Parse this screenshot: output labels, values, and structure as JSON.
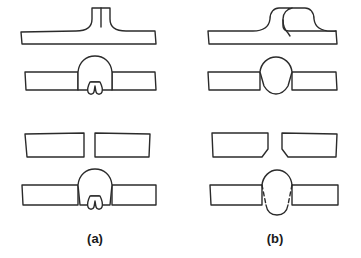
{
  "figure": {
    "background_color": "#ffffff",
    "line_color": "#2b2b2b",
    "fill_color": "#ffffff",
    "stroke_width": 1.4,
    "width": 361,
    "height": 258,
    "columns": [
      {
        "id": "a",
        "caption": "(a)",
        "caption_x": 95,
        "caption_y": 243,
        "description": "Improper joint preparation producing root defect"
      },
      {
        "id": "b",
        "caption": "(b)",
        "caption_x": 275,
        "caption_y": 243,
        "description": "Correct joint preparation producing sound weld"
      }
    ],
    "rows": [
      {
        "index": 0,
        "name": "tee-joint-preparation",
        "label": "T-joint / upset preparation, unwelded"
      },
      {
        "index": 1,
        "name": "tee-joint-welded",
        "label": "T-joint preparation after welding"
      },
      {
        "index": 2,
        "name": "butt-plate-preparation",
        "label": "Butt plates edge preparation, unwelded"
      },
      {
        "index": 3,
        "name": "butt-joint-welded",
        "label": "Butt joint after welding"
      }
    ],
    "panels": [
      {
        "name": "panel-a-row1",
        "column": "a",
        "row": 0,
        "type": "tee-preparation-square-root",
        "has_root_defect": false,
        "fusion_line_style": "solid"
      },
      {
        "name": "panel-b-row1",
        "column": "b",
        "row": 0,
        "type": "tee-preparation-j-groove",
        "has_root_defect": false,
        "fusion_line_style": "solid"
      },
      {
        "name": "panel-a-row2",
        "column": "a",
        "row": 1,
        "type": "weld-bead-with-root-crack",
        "has_root_defect": true,
        "fusion_line_style": "solid"
      },
      {
        "name": "panel-b-row2",
        "column": "b",
        "row": 1,
        "type": "weld-bead-sound",
        "has_root_defect": false,
        "fusion_line_style": "solid"
      },
      {
        "name": "panel-a-row3",
        "column": "a",
        "row": 2,
        "type": "square-edge-plates-gap",
        "has_root_defect": false,
        "fusion_line_style": "solid"
      },
      {
        "name": "panel-b-row3",
        "column": "b",
        "row": 2,
        "type": "chamfered-edge-plates-gap",
        "has_root_defect": false,
        "fusion_line_style": "solid"
      },
      {
        "name": "panel-a-row4",
        "column": "a",
        "row": 3,
        "type": "butt-weld-with-root-crack",
        "has_root_defect": true,
        "fusion_line_style": "solid"
      },
      {
        "name": "panel-b-row4",
        "column": "b",
        "row": 3,
        "type": "butt-weld-sound",
        "has_root_defect": false,
        "fusion_line_style": "dashed"
      }
    ]
  }
}
